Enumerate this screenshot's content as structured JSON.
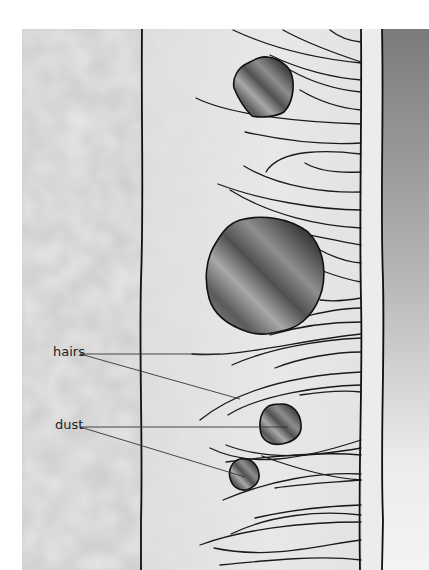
{
  "figure": {
    "labels": {
      "hairs": "hairs",
      "dust": "dust"
    },
    "colors": {
      "background": "#ffffff",
      "tissue_texture": "#d4d4d4",
      "lumen": "#e4e4e4",
      "wall": "#ededed",
      "outer_dark_top": "#7a7a7a",
      "outer_dark_bottom": "#f2f2f2",
      "particle_dark": "#3c3c3c",
      "particle_light": "#8c8c8c",
      "outline": "#111111",
      "leader_line": "#333333"
    },
    "dust_particles": [
      {
        "id": "small-top",
        "cx": 262,
        "cy": 88,
        "r": 28
      },
      {
        "id": "large-middle",
        "cx": 265,
        "cy": 275,
        "r": 58
      },
      {
        "id": "small-lower",
        "cx": 281,
        "cy": 425,
        "r": 20
      },
      {
        "id": "small-bottom",
        "cx": 244,
        "cy": 473,
        "r": 15
      }
    ]
  }
}
